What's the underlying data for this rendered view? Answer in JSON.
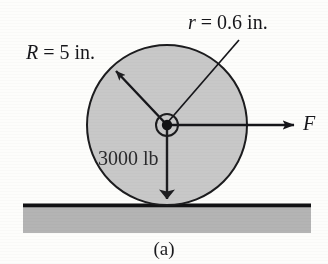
{
  "figure": {
    "caption": "(a)",
    "background_color": "#fdfdfb",
    "ink_color": "#16161a",
    "wheel": {
      "name": "wheel",
      "fill_color": "#c8c8c8",
      "stroke_color": "#1c1c1e",
      "center_x": 167,
      "center_y": 125,
      "radius_px": 80,
      "radius_label": "R = 5 in.",
      "radius_symbol": "R",
      "radius_value": "= 5 in."
    },
    "hub": {
      "name": "axle-hub",
      "center_x": 167,
      "center_y": 125,
      "outer_radius_px": 11,
      "dot_radius_px": 5,
      "radius_label": "r = 0.6 in.",
      "radius_symbol": "r",
      "radius_value": "= 0.6 in."
    },
    "force": {
      "name": "applied-force",
      "label": "F",
      "direction": "right",
      "from_x": 167,
      "from_y": 125,
      "to_x": 295,
      "to_y": 125
    },
    "weight": {
      "name": "weight-force",
      "label": "3000 lb",
      "direction": "down",
      "from_x": 167,
      "from_y": 125,
      "to_x": 167,
      "to_y": 201
    },
    "ground": {
      "name": "ground-surface",
      "line_color": "#111113",
      "band_color": "#b4b4b4",
      "left_x": 23,
      "right_x": 311,
      "line_y": 206,
      "band_bottom_y": 233
    }
  }
}
